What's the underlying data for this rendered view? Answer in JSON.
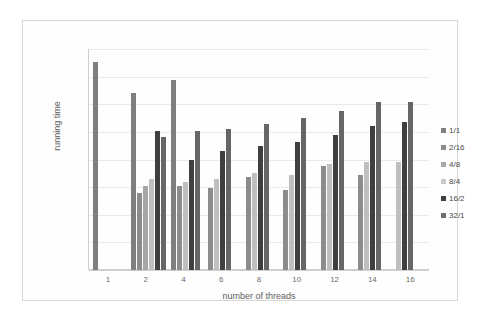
{
  "chart_data": {
    "type": "bar",
    "title": "",
    "xlabel": "number of threads",
    "ylabel": "running time",
    "categories": [
      "1",
      "2",
      "4",
      "6",
      "8",
      "10",
      "12",
      "14",
      "16"
    ],
    "legend_position": "right",
    "grid": true,
    "y_tick_labels": [],
    "ylim": [
      0,
      100
    ],
    "gridline_values": [
      0,
      12.5,
      25,
      37.5,
      50,
      62.5,
      75,
      87.5,
      100
    ],
    "series": [
      {
        "name": "1/1",
        "color": "#7f7f7f",
        "values": [
          94,
          80,
          86,
          null,
          null,
          null,
          null,
          null,
          null
        ]
      },
      {
        "name": "2/16",
        "color": "#8c8c8c",
        "values": [
          null,
          35,
          38,
          37,
          42,
          36,
          47,
          43,
          null
        ]
      },
      {
        "name": "4/8",
        "color": "#a6a6a6",
        "values": [
          null,
          38,
          null,
          null,
          null,
          null,
          null,
          null,
          null
        ]
      },
      {
        "name": "8/4",
        "color": "#bfbfbf",
        "values": [
          null,
          41,
          40,
          41,
          44,
          43,
          48,
          49,
          49
        ]
      },
      {
        "name": "16/2",
        "color": "#3f3f3f",
        "values": [
          null,
          63,
          50,
          54,
          56,
          58,
          61,
          65,
          67
        ]
      },
      {
        "name": "32/1",
        "color": "#666666",
        "values": [
          null,
          60,
          63,
          64,
          66,
          69,
          72,
          76,
          76
        ]
      }
    ]
  },
  "axes": {
    "x_title": "number of threads",
    "y_title": "running time",
    "x_ticks": [
      "1",
      "2",
      "4",
      "6",
      "8",
      "10",
      "12",
      "14",
      "16"
    ]
  },
  "legend": {
    "items": [
      {
        "label": "1/1",
        "color": "#7f7f7f"
      },
      {
        "label": "2/16",
        "color": "#8c8c8c"
      },
      {
        "label": "4/8",
        "color": "#a6a6a6"
      },
      {
        "label": "8/4",
        "color": "#c9c9c9"
      },
      {
        "label": "16/2",
        "color": "#3f3f3f"
      },
      {
        "label": "32/1",
        "color": "#6e6e6e"
      }
    ]
  },
  "colors": {
    "gridline": "#e9e9e9",
    "frame_border": "#d6d6d6",
    "axis": "#cfcfcf",
    "text": "#5c5c5c",
    "background": "#ffffff"
  }
}
